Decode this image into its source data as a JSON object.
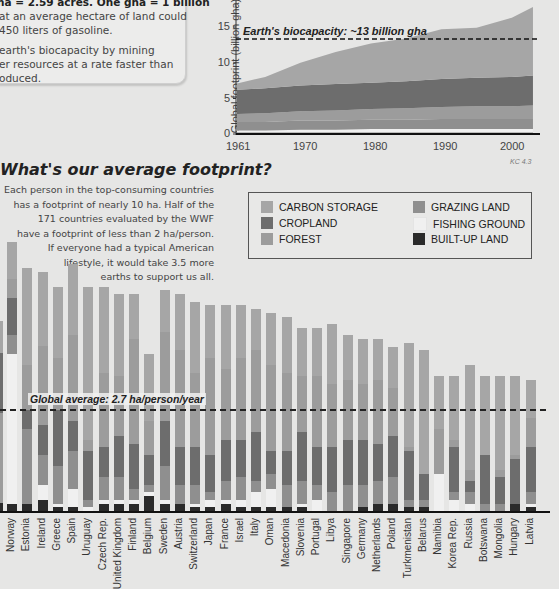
{
  "info_box": {
    "lines": [
      "ha = 2.59 acres. One gha = 1 billion",
      "at an average hectare of land could",
      "450 liters of gasoline.",
      "earth's biocapacity by mining",
      "er resources at a rate faster than",
      "oduced."
    ]
  },
  "colors": {
    "carbon_storage": "#a6a6a6",
    "cropland": "#6d6d6d",
    "forest": "#9c9c9c",
    "grazing_land": "#8f8f8f",
    "fishing_ground": "#f0f0f0",
    "built_up_land": "#2a2a2a",
    "background": "#e6e6e5"
  },
  "chart_data": [
    {
      "type": "area",
      "title": "",
      "xlabel": "",
      "ylabel": "Global footprint (billion gha)",
      "x": [
        1961,
        1965,
        1970,
        1975,
        1980,
        1985,
        1990,
        1995,
        2000,
        2003
      ],
      "xticks": [
        "1961",
        "1970",
        "1980",
        "1990",
        "2000"
      ],
      "yticks": [
        "0",
        "5",
        "10",
        "15"
      ],
      "ylim": [
        0,
        18
      ],
      "series": [
        {
          "name": "BUILT-UP LAND",
          "values": [
            0.2,
            0.2,
            0.2,
            0.2,
            0.2,
            0.2,
            0.2,
            0.2,
            0.2,
            0.2
          ]
        },
        {
          "name": "FISHING GROUND",
          "values": [
            0.3,
            0.3,
            0.4,
            0.4,
            0.5,
            0.5,
            0.5,
            0.5,
            0.5,
            0.5
          ]
        },
        {
          "name": "GRAZING LAND",
          "values": [
            1.2,
            1.2,
            1.3,
            1.3,
            1.3,
            1.3,
            1.4,
            1.4,
            1.4,
            1.4
          ]
        },
        {
          "name": "FOREST",
          "values": [
            1.1,
            1.2,
            1.3,
            1.4,
            1.5,
            1.6,
            1.7,
            1.8,
            1.8,
            1.9
          ]
        },
        {
          "name": "CROPLAND",
          "values": [
            3.4,
            3.5,
            3.6,
            3.7,
            3.7,
            3.8,
            3.9,
            4.0,
            4.1,
            4.2
          ]
        },
        {
          "name": "CARBON STORAGE",
          "values": [
            0.9,
            1.6,
            3.2,
            4.5,
            5.5,
            6.0,
            7.0,
            7.0,
            8.3,
            9.6
          ]
        }
      ],
      "annotation": "Earth's biocapacity: ~13 billion gha",
      "reference_line": 13.3,
      "source_label": "KC 4.3"
    },
    {
      "type": "bar",
      "stacked": true,
      "title": "What's our average footprint?",
      "ylabel": "ha/person",
      "annotation": "Global average: 2.7 ha/person/year",
      "reference_line": 2.7,
      "categories": [
        "Norway",
        "Estonia",
        "Ireland",
        "Greece",
        "Spain",
        "Uruguay",
        "Czech Rep.",
        "United Kingdom",
        "Finland",
        "Belgium",
        "Sweden",
        "Austria",
        "Switzerland",
        "Japan",
        "France",
        "Israel",
        "Italy",
        "Oman",
        "Macedonia",
        "Slovenia",
        "Portugal",
        "Libya",
        "Singapore",
        "Germany",
        "Netherlands",
        "Poland",
        "Turkmenistan",
        "Belarus",
        "Namibia",
        "Korea Rep.",
        "Russia",
        "Botswana",
        "Mongolia",
        "Hungary",
        "Latvia"
      ],
      "series": [
        {
          "name": "BUILT-UP LAND",
          "values": [
            0.2,
            0.2,
            0.3,
            0.1,
            0.1,
            0.0,
            0.2,
            0.2,
            0.2,
            0.4,
            0.2,
            0.2,
            0.1,
            0.1,
            0.2,
            0.1,
            0.1,
            0.1,
            0.1,
            0.1,
            0.0,
            0.0,
            0.0,
            0.1,
            0.2,
            0.2,
            0.1,
            0.1,
            0.0,
            0.0,
            0.0,
            0.0,
            0.0,
            0.2,
            0.1
          ]
        },
        {
          "name": "FISHING GROUND",
          "values": [
            4.0,
            0.0,
            0.4,
            0.1,
            0.5,
            0.1,
            0.1,
            0.1,
            0.1,
            0.1,
            0.1,
            0.0,
            0.1,
            0.2,
            0.1,
            0.2,
            0.4,
            0.5,
            0.0,
            0.1,
            0.3,
            0.0,
            0.0,
            0.0,
            0.0,
            0.0,
            0.0,
            0.0,
            1.0,
            0.3,
            0.2,
            0.0,
            0.0,
            0.0,
            0.1
          ]
        },
        {
          "name": "GRAZING LAND",
          "values": [
            0.5,
            2.0,
            0.8,
            1.0,
            1.0,
            0.2,
            0.6,
            0.6,
            0.3,
            0.2,
            0.9,
            0.5,
            0.5,
            0.2,
            0.5,
            0.6,
            0.3,
            0.4,
            0.6,
            0.6,
            0.4,
            0.5,
            0.7,
            0.6,
            0.6,
            0.7,
            0.2,
            0.2,
            0.0,
            0.2,
            0.3,
            0.2,
            0.2,
            0.0,
            0.3
          ]
        },
        {
          "name": "CROPLAND",
          "values": [
            1.0,
            0.5,
            0.8,
            1.5,
            0.8,
            1.3,
            0.8,
            1.1,
            1.2,
            0.8,
            1.2,
            1.0,
            1.0,
            1.0,
            1.1,
            1.0,
            1.3,
            0.6,
            0.9,
            1.3,
            1.0,
            1.2,
            1.2,
            1.2,
            1.0,
            1.1,
            1.3,
            0.7,
            0.0,
            1.2,
            0.3,
            1.3,
            0.7,
            1.2,
            1.2
          ]
        },
        {
          "name": "FOREST",
          "values": [
            0.5,
            1.2,
            2.1,
            1.4,
            2.3,
            0.3,
            2.0,
            1.6,
            2.8,
            0.9,
            2.4,
            2.6,
            2.0,
            2.6,
            1.9,
            2.2,
            2.2,
            2.3,
            2.1,
            1.5,
            1.9,
            1.7,
            1.6,
            1.5,
            1.7,
            1.3,
            0.1,
            0.0,
            1.2,
            0.2,
            0.3,
            0.0,
            0.2,
            0.1,
            0.8
          ]
        },
        {
          "name": "CARBON STORAGE",
          "values": [
            1.0,
            2.6,
            2.0,
            1.9,
            1.9,
            4.1,
            2.3,
            2.2,
            1.2,
            1.8,
            1.1,
            1.5,
            1.9,
            1.4,
            1.7,
            1.4,
            1.1,
            1.4,
            1.5,
            1.3,
            1.3,
            1.6,
            1.2,
            1.2,
            1.1,
            1.1,
            2.8,
            3.3,
            1.4,
            1.7,
            2.8,
            2.1,
            2.5,
            2.1,
            1.0
          ]
        }
      ],
      "totals": [
        7.2,
        6.6,
        6.4,
        6.0,
        5.9,
        5.6,
        5.5,
        5.4,
        5.4,
        5.2,
        5.2,
        5.1,
        5.1,
        5.0,
        5.0,
        4.9,
        4.9,
        4.8,
        4.7,
        4.6,
        4.5,
        4.4,
        4.3,
        4.3,
        4.1,
        4.1,
        4.0,
        4.0,
        3.9,
        3.9,
        3.9,
        3.8,
        3.7,
        3.7,
        3.6
      ]
    }
  ],
  "heading": "What's our average footprint?",
  "paragraph": [
    "Each person in the top-consuming countries",
    "has a footprint of nearly 10 ha. Half of the",
    "171 countries evaluated by the WWF",
    "have a footprint of less than 2 ha/person.",
    "If everyone had a typical American",
    "lifestyle, it would take 3.5 more",
    "earths to support us all."
  ],
  "legend": [
    {
      "label": "CARBON STORAGE",
      "color": "#a6a6a6"
    },
    {
      "label": "CROPLAND",
      "color": "#6d6d6d"
    },
    {
      "label": "FOREST",
      "color": "#9c9c9c"
    },
    {
      "label": "GRAZING LAND",
      "color": "#8f8f8f"
    },
    {
      "label": "FISHING GROUND",
      "color": "#f0f0f0"
    },
    {
      "label": "BUILT-UP LAND",
      "color": "#2a2a2a"
    }
  ],
  "area_chart": {
    "ylabel": "Global footprint (billion gha)",
    "annotation": "Earth's biocapacity: ~13 billion gha",
    "source": "KC 4.3"
  },
  "bar_chart": {
    "avg_label": "Global average: 2.7 ha/person/year"
  }
}
